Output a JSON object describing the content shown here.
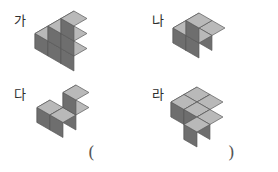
{
  "page": {
    "width": 278,
    "height": 172,
    "background": "#ffffff"
  },
  "cube_colors": {
    "top": "#b9b9b9",
    "left": "#8f8f8f",
    "right": "#6e6e6e",
    "outline": "#5a5a5a"
  },
  "figures": [
    {
      "id": "ga",
      "label": "가",
      "label_x": 14,
      "label_y": 14,
      "stage_x": 34,
      "stage_y": 10,
      "cube_size": 15,
      "cube_count": 6,
      "description": "staircase-of-cubes",
      "cubes": [
        {
          "x": 0,
          "y": 0,
          "z": 0
        },
        {
          "x": 1,
          "y": 0,
          "z": 0
        },
        {
          "x": 2,
          "y": 0,
          "z": 0
        },
        {
          "x": 1,
          "y": 0,
          "z": 1
        },
        {
          "x": 2,
          "y": 0,
          "z": 1
        },
        {
          "x": 2,
          "y": 0,
          "z": 2
        }
      ]
    },
    {
      "id": "na",
      "label": "나",
      "label_x": 152,
      "label_y": 14,
      "stage_x": 172,
      "stage_y": 12,
      "cube_size": 15,
      "cube_count": 4,
      "description": "tri-cube-with-raised-center",
      "cubes": [
        {
          "x": 0,
          "y": 1,
          "z": 0
        },
        {
          "x": 1,
          "y": 1,
          "z": 0
        },
        {
          "x": 1,
          "y": 0,
          "z": 0
        },
        {
          "x": 1,
          "y": 1,
          "z": 1
        }
      ]
    },
    {
      "id": "da",
      "label": "다",
      "label_x": 14,
      "label_y": 88,
      "stage_x": 36,
      "stage_y": 84,
      "cube_size": 15,
      "cube_count": 4,
      "description": "L-shape-with-raised-back-cube",
      "cubes": [
        {
          "x": 0,
          "y": 1,
          "z": 0
        },
        {
          "x": 1,
          "y": 1,
          "z": 0
        },
        {
          "x": 1,
          "y": 0,
          "z": 0
        },
        {
          "x": 1,
          "y": 0,
          "z": 1
        }
      ]
    },
    {
      "id": "ra",
      "label": "라",
      "label_x": 152,
      "label_y": 88,
      "stage_x": 170,
      "stage_y": 86,
      "cube_size": 15,
      "cube_count": 6,
      "description": "flat-S-shape-single-layer",
      "cubes": [
        {
          "x": 0,
          "y": 0,
          "z": 0
        },
        {
          "x": 0,
          "y": 1,
          "z": 0
        },
        {
          "x": 1,
          "y": 1,
          "z": 0
        },
        {
          "x": 2,
          "y": 1,
          "z": 0
        },
        {
          "x": 2,
          "y": 2,
          "z": 0
        },
        {
          "x": 1,
          "y": 0,
          "z": 0
        }
      ]
    }
  ],
  "answer": {
    "open_paren": "(",
    "close_paren": ")",
    "value": ""
  }
}
